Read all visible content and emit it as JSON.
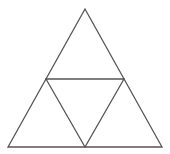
{
  "diagram": {
    "stroke_color": "#555555",
    "background": "#ffffff",
    "outer_triangle": {
      "points": "85,9 8,147 162,147"
    },
    "inner_triangle": {
      "points": "46,79 124,79 85,147"
    }
  }
}
